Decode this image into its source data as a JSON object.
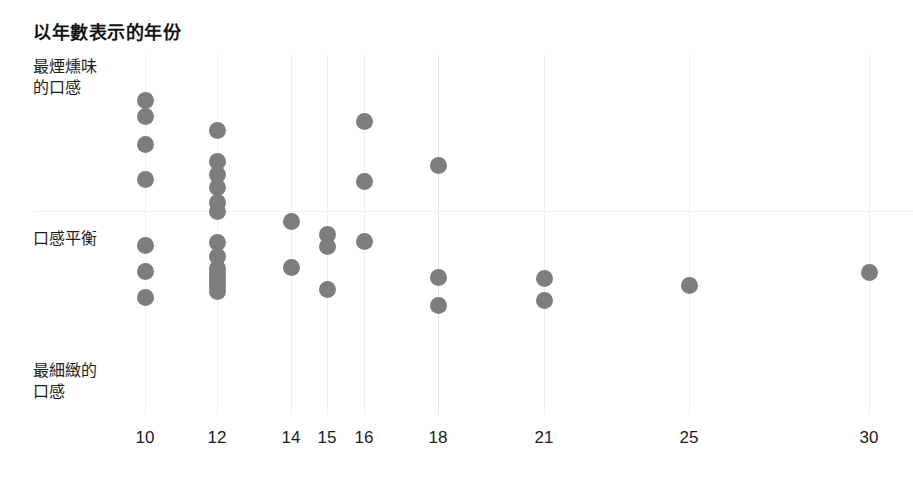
{
  "chart_data": {
    "type": "scatter",
    "title": "以年數表示的年份",
    "xlabel": "",
    "ylabel": "",
    "grid": true,
    "legend": false,
    "xlim": [
      9,
      31
    ],
    "ylim": [
      0,
      10
    ],
    "x_tick_labels": [
      "10",
      "12",
      "14",
      "15",
      "16",
      "18",
      "21",
      "25",
      "30"
    ],
    "x_tick_values": [
      10,
      12,
      14,
      15,
      16,
      18,
      21,
      25,
      30
    ],
    "y_axis_categories": [
      {
        "key": "top",
        "label": "最煙燻味\n的口感"
      },
      {
        "key": "mid",
        "label": "口感平衡"
      },
      {
        "key": "bottom",
        "label": "最細緻的\n口感"
      }
    ],
    "y_label_top_line1": "最煙燻味",
    "y_label_top_line2": "的口感",
    "y_label_mid": "口感平衡",
    "y_label_bottom_line1": "最細緻的",
    "y_label_bottom_line2": "口感",
    "dot_color": "#7d7d7d",
    "point_count": 36,
    "points": [
      {
        "x": 10,
        "y": 9.1
      },
      {
        "x": 10,
        "y": 8.62
      },
      {
        "x": 10,
        "y": 7.77
      },
      {
        "x": 10,
        "y": 6.7
      },
      {
        "x": 10,
        "y": 4.67
      },
      {
        "x": 10,
        "y": 3.88
      },
      {
        "x": 10,
        "y": 3.08
      },
      {
        "x": 12,
        "y": 8.2
      },
      {
        "x": 12,
        "y": 7.23
      },
      {
        "x": 12,
        "y": 6.83
      },
      {
        "x": 12,
        "y": 6.44
      },
      {
        "x": 12,
        "y": 5.99
      },
      {
        "x": 12,
        "y": 5.73
      },
      {
        "x": 12,
        "y": 4.76
      },
      {
        "x": 12,
        "y": 4.35
      },
      {
        "x": 12,
        "y": 3.98
      },
      {
        "x": 12,
        "y": 3.84
      },
      {
        "x": 12,
        "y": 3.7
      },
      {
        "x": 12,
        "y": 3.56
      },
      {
        "x": 12,
        "y": 3.42
      },
      {
        "x": 12,
        "y": 3.28
      },
      {
        "x": 14,
        "y": 5.42
      },
      {
        "x": 14,
        "y": 4.0
      },
      {
        "x": 15,
        "y": 5.03
      },
      {
        "x": 15,
        "y": 4.64
      },
      {
        "x": 15,
        "y": 3.33
      },
      {
        "x": 16,
        "y": 8.47
      },
      {
        "x": 16,
        "y": 6.63
      },
      {
        "x": 16,
        "y": 4.8
      },
      {
        "x": 18,
        "y": 7.13
      },
      {
        "x": 18,
        "y": 3.69
      },
      {
        "x": 18,
        "y": 2.85
      },
      {
        "x": 21,
        "y": 3.67
      },
      {
        "x": 21,
        "y": 3.0
      },
      {
        "x": 25,
        "y": 3.45
      },
      {
        "x": 30,
        "y": 3.86
      }
    ]
  }
}
